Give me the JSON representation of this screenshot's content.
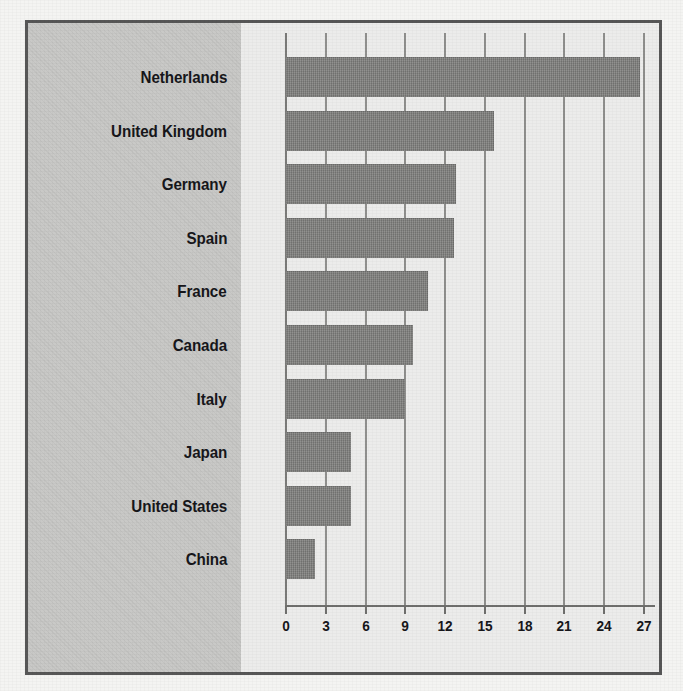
{
  "colors": {
    "bar_fill": "#7b7b79",
    "label_panel_bg": "#c9c9c7",
    "plot_bg": "#ececeb",
    "frame_border": "#575757",
    "gridline": "#8f8f8d",
    "text": "#16161a"
  },
  "chart_data": {
    "type": "bar",
    "orientation": "horizontal",
    "title": "",
    "subtitle": "",
    "xlabel": "",
    "ylabel": "",
    "categories": [
      "Netherlands",
      "United Kingdom",
      "Germany",
      "Spain",
      "France",
      "Canada",
      "Italy",
      "Japan",
      "United States",
      "China"
    ],
    "values": [
      26.7,
      15.7,
      12.8,
      12.7,
      10.7,
      9.6,
      9.0,
      4.9,
      4.9,
      2.2
    ],
    "series": [
      {
        "name": "",
        "values": [
          26.7,
          15.7,
          12.8,
          12.7,
          10.7,
          9.6,
          9.0,
          4.9,
          4.9,
          2.2
        ]
      }
    ],
    "xticks": [
      0,
      3,
      6,
      9,
      12,
      15,
      18,
      21,
      24,
      27
    ],
    "xtick_labels": [
      "0",
      "3",
      "6",
      "9",
      "12",
      "15",
      "18",
      "21",
      "24",
      "27"
    ],
    "xlim": [
      0,
      27
    ],
    "grid": "vertical",
    "legend": "none",
    "annotations": []
  }
}
